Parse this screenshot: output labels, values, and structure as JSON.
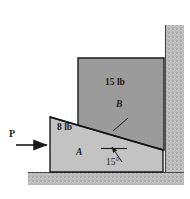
{
  "figure": {
    "colors": {
      "wedge_a_fill": "#c3c3c3",
      "block_b_fill": "#9b9b9b",
      "outline": "#1a1a1a",
      "hatch_fill": "#c9c9c9",
      "hatch_dot": "#8f8f8f",
      "background": "#ffffff"
    },
    "labels": {
      "force_p": "P",
      "weight_a": "8 lb",
      "body_a": "A",
      "weight_b": "15 lb",
      "body_b": "B",
      "angle": "15°"
    },
    "icons": {
      "force_arrow": "right-arrow-icon",
      "angle_leader": "angle-leader-arrow-icon",
      "contact_leader": "contact-leader-line-icon",
      "wall_hatch": "fixed-support-hatch-icon",
      "ground_hatch": "fixed-support-hatch-icon"
    },
    "geometry": {
      "wedge_a": {
        "points": "50,117 163,150 163,172 50,172",
        "description": "lower wedge A, inclined top face"
      },
      "block_b": {
        "points": "78,58 164,58 164,150 78,128",
        "description": "upper block B resting on incline, against wall"
      },
      "wall": {
        "x": 165,
        "y": 25,
        "width": 19,
        "height": 147
      },
      "ground": {
        "x": 28,
        "y": 172,
        "width": 156,
        "height": 13
      },
      "force_arrow": {
        "x1": 16,
        "y1": 145,
        "x2": 50,
        "y2": 145
      },
      "angle_arc_vertex": {
        "x": 163,
        "y": 150
      },
      "angle_ref_line": {
        "x1": 101,
        "y1": 148,
        "x2": 127,
        "y2": 148
      },
      "angle_leader": {
        "x1": 120,
        "y1": 160,
        "x2": 112,
        "y2": 147
      },
      "contact_leader": {
        "x1": 126,
        "y1": 120,
        "x2": 112,
        "y2": 132
      }
    }
  }
}
